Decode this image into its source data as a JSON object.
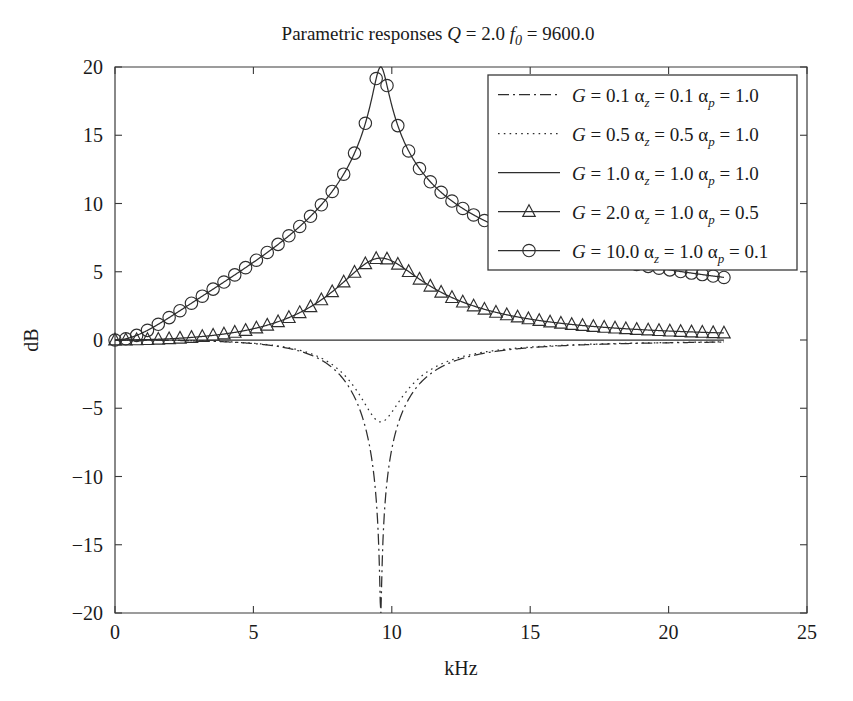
{
  "chart_data": {
    "type": "line",
    "title": "Parametric responses Q = 2.0 f0 = 9600.0",
    "title_parts": {
      "prefix": "Parametric responses ",
      "q_symbol": "Q",
      "q_eq": " = 2.0 ",
      "f_symbol": "f",
      "f_sub": "0",
      "f_eq": " = 9600.0"
    },
    "xlabel": "kHz",
    "ylabel": "dB",
    "xlim": [
      0,
      25
    ],
    "ylim": [
      -20,
      20
    ],
    "xticks": [
      0,
      5,
      10,
      15,
      20,
      25
    ],
    "xticklabels": [
      "0",
      "5",
      "10",
      "15",
      "20",
      "25"
    ],
    "yticks": [
      -20,
      -15,
      -10,
      -5,
      0,
      5,
      10,
      15,
      20
    ],
    "yticklabels": [
      "−20",
      "−15",
      "−10",
      "−5",
      "0",
      "5",
      "10",
      "15",
      "20"
    ],
    "grid": false,
    "legend_position": "upper right",
    "f0_khz": 9.6,
    "Q": 2.0,
    "x_data_range": [
      0,
      22
    ],
    "series": [
      {
        "name": "G = 0.1  αz = 0.1  αp = 1.0",
        "legend": {
          "g_symbol": "G",
          "g_value": " = 0.1  ",
          "az_symbol": "α",
          "az_sub": "z",
          "az_value": " = 0.1  ",
          "ap_symbol": "α",
          "ap_sub": "p",
          "ap_value": " = 1.0"
        },
        "G": 0.1,
        "alpha_z": 0.1,
        "alpha_p": 1.0,
        "linestyle": "dashdot",
        "marker": "none",
        "peak_db": -20.0,
        "peak_khz": 9.6,
        "baseline_db": 0.0,
        "color": "#2e2e2e"
      },
      {
        "name": "G = 0.5  αz = 0.5  αp = 1.0",
        "legend": {
          "g_symbol": "G",
          "g_value": " = 0.5  ",
          "az_symbol": "α",
          "az_sub": "z",
          "az_value": " = 0.5  ",
          "ap_symbol": "α",
          "ap_sub": "p",
          "ap_value": " = 1.0"
        },
        "G": 0.5,
        "alpha_z": 0.5,
        "alpha_p": 1.0,
        "linestyle": "dotted",
        "marker": "none",
        "peak_db": -6.0,
        "peak_khz": 9.6,
        "baseline_db": 0.0,
        "color": "#2e2e2e"
      },
      {
        "name": "G = 1.0  αz = 1.0  αp = 1.0",
        "legend": {
          "g_symbol": "G",
          "g_value": " = 1.0  ",
          "az_symbol": "α",
          "az_sub": "z",
          "az_value": " = 1.0  ",
          "ap_symbol": "α",
          "ap_sub": "p",
          "ap_value": " = 1.0"
        },
        "G": 1.0,
        "alpha_z": 1.0,
        "alpha_p": 1.0,
        "linestyle": "solid",
        "marker": "none",
        "peak_db": 0.0,
        "peak_khz": 9.6,
        "baseline_db": 0.0,
        "color": "#2e2e2e"
      },
      {
        "name": "G = 2.0  αz = 1.0  αp = 0.5",
        "legend": {
          "g_symbol": "G",
          "g_value": " = 2.0  ",
          "az_symbol": "α",
          "az_sub": "z",
          "az_value": " = 1.0  ",
          "ap_symbol": "α",
          "ap_sub": "p",
          "ap_value": " = 0.5"
        },
        "G": 2.0,
        "alpha_z": 1.0,
        "alpha_p": 0.5,
        "linestyle": "solid",
        "marker": "triangle",
        "peak_db": 6.0,
        "peak_khz": 9.6,
        "baseline_db": 0.2,
        "color": "#2e2e2e"
      },
      {
        "name": "G = 10.0  αz = 1.0  αp = 0.1",
        "legend": {
          "g_symbol": "G",
          "g_value": " = 10.0  ",
          "az_symbol": "α",
          "az_sub": "z",
          "az_value": " = 1.0  ",
          "ap_symbol": "α",
          "ap_sub": "p",
          "ap_value": " = 0.1"
        },
        "G": 10.0,
        "alpha_z": 1.0,
        "alpha_p": 0.1,
        "linestyle": "solid",
        "marker": "circle",
        "peak_db": 20.0,
        "peak_khz": 9.6,
        "baseline_db": 0.5,
        "color": "#2e2e2e"
      }
    ]
  },
  "figure": {
    "background": "#ffffff",
    "axis_color": "#3a3a3a",
    "line_color": "#2e2e2e"
  }
}
